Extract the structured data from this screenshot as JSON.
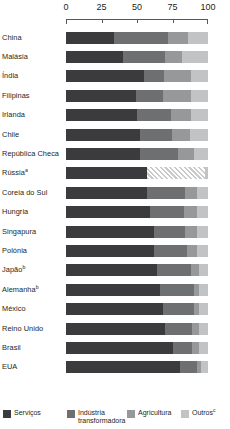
{
  "chart_data": {
    "type": "bar",
    "orientation": "horizontal",
    "stacked": true,
    "title": "",
    "xlabel": "",
    "ylabel": "",
    "xlim": [
      0,
      100
    ],
    "grid": false,
    "axis_ticks": [
      0,
      25,
      50,
      75,
      100
    ],
    "axis_tick_labels": [
      "0",
      "25",
      "50",
      "75",
      "100"
    ],
    "legend_position": "bottom",
    "series": [
      {
        "name": "Serviços",
        "key": "services",
        "color": "#3b3b3d",
        "values": [
          34,
          40,
          55,
          49,
          50,
          52,
          52,
          57,
          57,
          59,
          62,
          62,
          64,
          66,
          68,
          70,
          75,
          80
        ]
      },
      {
        "name": "Indústria transformadora",
        "key": "industry",
        "color": "#6e6f71",
        "values": [
          38,
          30,
          14,
          19,
          24,
          23,
          27,
          27,
          27,
          24,
          22,
          23,
          24,
          24,
          22,
          19,
          14,
          12
        ]
      },
      {
        "name": "Agricultura",
        "key": "agriculture",
        "color": "#97989a",
        "values": [
          14,
          12,
          19,
          20,
          14,
          12,
          11,
          9,
          8,
          9,
          8,
          7,
          6,
          4,
          4,
          5,
          5,
          3
        ]
      },
      {
        "name": "Outros",
        "key": "other",
        "color": "#c2c3c5",
        "values": [
          14,
          18,
          12,
          12,
          12,
          13,
          10,
          7,
          8,
          8,
          8,
          8,
          6,
          6,
          6,
          6,
          6,
          5
        ]
      }
    ],
    "categories": [
      "China",
      "Malásia",
      "Índia",
      "Filipinas",
      "Irlanda",
      "Chile",
      "República Checa",
      "Rússia",
      "Coreia do Sul",
      "Hungria",
      "Singapura",
      "Polónia",
      "Japão",
      "Alemanha",
      "México",
      "Reino Unido",
      "Brasil",
      "EUA"
    ]
  },
  "axis": {
    "ticks": [
      {
        "label": "0",
        "value": 0
      },
      {
        "label": "25",
        "value": 25
      },
      {
        "label": "50",
        "value": 50
      },
      {
        "label": "75",
        "value": 75
      },
      {
        "label": "100",
        "value": 100
      }
    ]
  },
  "rows": [
    {
      "label": "China",
      "note": "",
      "hatched": false,
      "segments": [
        {
          "key": "services",
          "value": 34
        },
        {
          "key": "industry",
          "value": 38
        },
        {
          "key": "agriculture",
          "value": 14
        },
        {
          "key": "other",
          "value": 14
        }
      ]
    },
    {
      "label": "Malásia",
      "note": "",
      "hatched": false,
      "segments": [
        {
          "key": "services",
          "value": 40
        },
        {
          "key": "industry",
          "value": 30
        },
        {
          "key": "agriculture",
          "value": 12
        },
        {
          "key": "other",
          "value": 18
        }
      ]
    },
    {
      "label": "Índia",
      "note": "",
      "hatched": false,
      "segments": [
        {
          "key": "services",
          "value": 55
        },
        {
          "key": "industry",
          "value": 14
        },
        {
          "key": "agriculture",
          "value": 19
        },
        {
          "key": "other",
          "value": 12
        }
      ]
    },
    {
      "label": "Filipinas",
      "note": "",
      "hatched": false,
      "segments": [
        {
          "key": "services",
          "value": 49
        },
        {
          "key": "industry",
          "value": 19
        },
        {
          "key": "agriculture",
          "value": 20
        },
        {
          "key": "other",
          "value": 12
        }
      ]
    },
    {
      "label": "Irlanda",
      "note": "",
      "hatched": false,
      "segments": [
        {
          "key": "services",
          "value": 50
        },
        {
          "key": "industry",
          "value": 24
        },
        {
          "key": "agriculture",
          "value": 14
        },
        {
          "key": "other",
          "value": 12
        }
      ]
    },
    {
      "label": "Chile",
      "note": "",
      "hatched": false,
      "segments": [
        {
          "key": "services",
          "value": 52
        },
        {
          "key": "industry",
          "value": 23
        },
        {
          "key": "agriculture",
          "value": 12
        },
        {
          "key": "other",
          "value": 13
        }
      ]
    },
    {
      "label": "República Checa",
      "note": "",
      "hatched": false,
      "segments": [
        {
          "key": "services",
          "value": 52
        },
        {
          "key": "industry",
          "value": 27
        },
        {
          "key": "agriculture",
          "value": 11
        },
        {
          "key": "other",
          "value": 10
        }
      ]
    },
    {
      "label": "Rússia",
      "note": "a",
      "hatched": true,
      "segments": [
        {
          "key": "services",
          "value": 57
        },
        {
          "key": "industry",
          "value": 41
        },
        {
          "key": "agriculture",
          "value": 0
        },
        {
          "key": "other",
          "value": 2
        }
      ]
    },
    {
      "label": "Coreia do Sul",
      "note": "",
      "hatched": false,
      "segments": [
        {
          "key": "services",
          "value": 57
        },
        {
          "key": "industry",
          "value": 27
        },
        {
          "key": "agriculture",
          "value": 8
        },
        {
          "key": "other",
          "value": 8
        }
      ]
    },
    {
      "label": "Hungria",
      "note": "",
      "hatched": false,
      "segments": [
        {
          "key": "services",
          "value": 59
        },
        {
          "key": "industry",
          "value": 24
        },
        {
          "key": "agriculture",
          "value": 9
        },
        {
          "key": "other",
          "value": 8
        }
      ]
    },
    {
      "label": "Singapura",
      "note": "",
      "hatched": false,
      "segments": [
        {
          "key": "services",
          "value": 62
        },
        {
          "key": "industry",
          "value": 22
        },
        {
          "key": "agriculture",
          "value": 8
        },
        {
          "key": "other",
          "value": 8
        }
      ]
    },
    {
      "label": "Polónia",
      "note": "",
      "hatched": false,
      "segments": [
        {
          "key": "services",
          "value": 62
        },
        {
          "key": "industry",
          "value": 23
        },
        {
          "key": "agriculture",
          "value": 7
        },
        {
          "key": "other",
          "value": 8
        }
      ]
    },
    {
      "label": "Japão",
      "note": "b",
      "hatched": false,
      "segments": [
        {
          "key": "services",
          "value": 64
        },
        {
          "key": "industry",
          "value": 24
        },
        {
          "key": "agriculture",
          "value": 6
        },
        {
          "key": "other",
          "value": 6
        }
      ]
    },
    {
      "label": "Alemanha",
      "note": "b",
      "hatched": false,
      "segments": [
        {
          "key": "services",
          "value": 66
        },
        {
          "key": "industry",
          "value": 24
        },
        {
          "key": "agriculture",
          "value": 4
        },
        {
          "key": "other",
          "value": 6
        }
      ]
    },
    {
      "label": "México",
      "note": "",
      "hatched": false,
      "segments": [
        {
          "key": "services",
          "value": 68
        },
        {
          "key": "industry",
          "value": 22
        },
        {
          "key": "agriculture",
          "value": 4
        },
        {
          "key": "other",
          "value": 6
        }
      ]
    },
    {
      "label": "Reino Unido",
      "note": "",
      "hatched": false,
      "segments": [
        {
          "key": "services",
          "value": 70
        },
        {
          "key": "industry",
          "value": 19
        },
        {
          "key": "agriculture",
          "value": 5
        },
        {
          "key": "other",
          "value": 6
        }
      ]
    },
    {
      "label": "Brasil",
      "note": "",
      "hatched": false,
      "segments": [
        {
          "key": "services",
          "value": 75
        },
        {
          "key": "industry",
          "value": 14
        },
        {
          "key": "agriculture",
          "value": 5
        },
        {
          "key": "other",
          "value": 6
        }
      ]
    },
    {
      "label": "EUA",
      "note": "",
      "hatched": false,
      "segments": [
        {
          "key": "services",
          "value": 80
        },
        {
          "key": "industry",
          "value": 12
        },
        {
          "key": "agriculture",
          "value": 3
        },
        {
          "key": "other",
          "value": 5
        }
      ]
    }
  ],
  "legend": {
    "items": [
      {
        "label": "Serviços",
        "note": "",
        "key": "services",
        "color": "#3b3b3d"
      },
      {
        "label": "Indústria transformadora",
        "note": "",
        "key": "industry",
        "color": "#6e6f71"
      },
      {
        "label": "Agricultura",
        "note": "",
        "key": "agriculture",
        "color": "#97989a"
      },
      {
        "label": "Outros",
        "note": "c",
        "key": "other",
        "color": "#c2c3c5"
      }
    ]
  }
}
